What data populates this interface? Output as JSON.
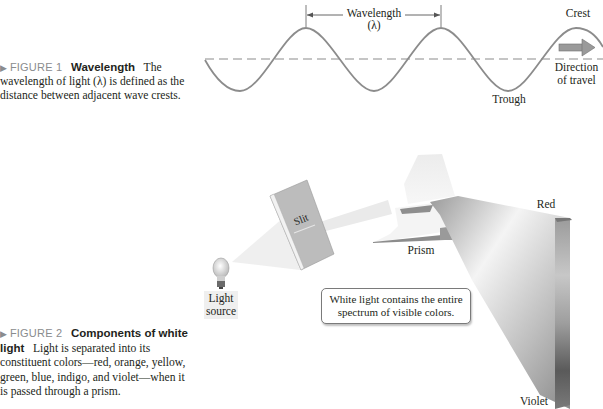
{
  "figure1": {
    "marker": "▶",
    "number": "FIGURE 1",
    "title": "Wavelength",
    "body": "The wavelength of light (λ) is defined as the distance between adjacent wave crests.",
    "labels": {
      "wavelength": "Wavelength",
      "lambda": "(λ)",
      "crest": "Crest",
      "trough": "Trough",
      "direction_line1": "Direction",
      "direction_line2": "of travel"
    },
    "icons": [
      "direction-arrow-icon"
    ]
  },
  "figure2": {
    "marker": "▶",
    "number": "FIGURE 2",
    "title": "Components of white light",
    "body": "Light is separated into its constituent colors—red, orange, yellow, green, blue, indigo, and violet—when it is passed through a prism.",
    "labels": {
      "light_source_line1": "Light",
      "light_source_line2": "source",
      "slit": "Slit",
      "prism": "Prism",
      "red": "Red",
      "violet": "Violet",
      "callout_line1": "White light contains the entire",
      "callout_line2": "spectrum of visible colors."
    },
    "icons": [
      "light-bulb-icon"
    ]
  },
  "colors": {
    "wave_stroke": "#8c8c8c",
    "caption_figure_label": "#8a8c8e",
    "text": "#231f20"
  }
}
